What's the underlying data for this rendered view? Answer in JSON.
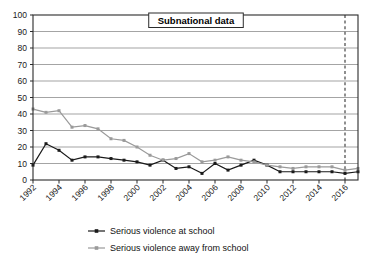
{
  "chart_data": {
    "type": "line",
    "title": "Subnational data",
    "xlabel": "",
    "ylabel": "",
    "ylim": [
      0,
      100
    ],
    "ytick_step": 10,
    "yticks": [
      0,
      10,
      20,
      30,
      40,
      50,
      60,
      70,
      80,
      90,
      100
    ],
    "grid": true,
    "legend_position": "bottom",
    "xlim": [
      1992,
      2017
    ],
    "x": [
      1992,
      1993,
      1994,
      1995,
      1996,
      1997,
      1998,
      1999,
      2000,
      2001,
      2002,
      2003,
      2004,
      2005,
      2006,
      2007,
      2008,
      2009,
      2010,
      2011,
      2012,
      2013,
      2014,
      2015,
      2016,
      2017
    ],
    "xtick_labels": [
      "1992",
      "1994",
      "1996",
      "1998",
      "2000",
      "2002",
      "2004",
      "2006",
      "2008",
      "2010",
      "2012",
      "2014",
      "2016"
    ],
    "xtick_values": [
      1992,
      1994,
      1996,
      1998,
      2000,
      2002,
      2004,
      2006,
      2008,
      2010,
      2012,
      2014,
      2016
    ],
    "annotations": [
      {
        "type": "vertical-dashed-line",
        "x": 2016,
        "label": ""
      }
    ],
    "series": [
      {
        "name": "Serious violence at school",
        "color": "#1a1a1a",
        "marker": "square",
        "values": [
          9,
          22,
          18,
          12,
          14,
          14,
          13,
          12,
          11,
          9,
          12,
          7,
          8,
          4,
          10,
          6,
          9,
          12,
          9,
          5,
          5,
          5,
          5,
          5,
          4,
          5
        ]
      },
      {
        "name": "Serious violence away from school",
        "color": "#9a9a9a",
        "marker": "square",
        "values": [
          43,
          41,
          42,
          32,
          33,
          31,
          25,
          24,
          20,
          15,
          12,
          13,
          16,
          11,
          12,
          14,
          12,
          11,
          9,
          8,
          7,
          8,
          8,
          8,
          6,
          7
        ]
      }
    ]
  },
  "legend": {
    "items": [
      {
        "label": "Serious violence at school",
        "color": "#1a1a1a"
      },
      {
        "label": "Serious violence away from school",
        "color": "#9a9a9a"
      }
    ]
  }
}
